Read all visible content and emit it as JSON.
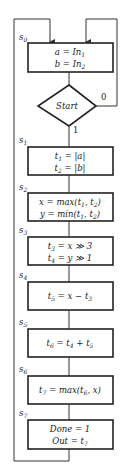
{
  "diagram": {
    "type": "state-flowchart",
    "line_color": "#333333",
    "background": "#ffffff",
    "decision": {
      "label": "Start",
      "true_label": "1",
      "false_label": "0"
    },
    "states": [
      {
        "name": "s0",
        "lines": [
          "a = In1",
          "b = In2"
        ]
      },
      {
        "name": "s1",
        "lines": [
          "t1 = |a|",
          "t2 = |b|"
        ]
      },
      {
        "name": "s2",
        "lines": [
          "x = max(t1, t2)",
          "y = min(t1, t2)"
        ]
      },
      {
        "name": "s3",
        "lines": [
          "t3 = x >> 3",
          "t4 = y >> 1"
        ]
      },
      {
        "name": "s4",
        "lines": [
          "t5 = x − t3"
        ]
      },
      {
        "name": "s5",
        "lines": [
          "t6 = t4 + t5"
        ]
      },
      {
        "name": "s6",
        "lines": [
          "t7 = max(t6, x)"
        ]
      },
      {
        "name": "s7",
        "lines": [
          "Done = 1",
          "Out = t7"
        ]
      }
    ]
  }
}
